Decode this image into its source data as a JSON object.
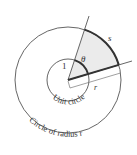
{
  "diagram": {
    "type": "arc-length-radius-diagram",
    "center": [
      68,
      80
    ],
    "unit_radius": 21,
    "outer_radius": 53,
    "upper_ray_end": [
      89,
      16
    ],
    "lower_ray_end": [
      132,
      61
    ],
    "colors": {
      "stroke": "#555555",
      "bold_stroke": "#333333",
      "shade": "#ebebeb",
      "text": "#333333"
    },
    "labels": {
      "arc_length": "s",
      "angle": "θ",
      "unit_radius": "1",
      "radius": "r",
      "unit_circle": "Unit circle",
      "outer_circle": "Circle of radius r"
    }
  }
}
